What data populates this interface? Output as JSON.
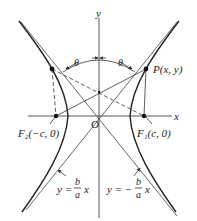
{
  "figure": {
    "type": "hyperbola-diagram",
    "axes": {
      "x_label": "x",
      "y_label": "y",
      "origin_label": "O"
    },
    "points": {
      "P": "P(x, y)",
      "F1": "F₁(c, 0)",
      "F2": "F₂(−c, 0)"
    },
    "angle_label": "θ",
    "asymptote_left": {
      "lhs": "y =",
      "num": "b",
      "den": "a",
      "rhs": "x"
    },
    "asymptote_right": {
      "lhs": "y = −",
      "num": "b",
      "den": "a",
      "rhs": "x"
    },
    "colors": {
      "line": "#333333",
      "background": "#ffffff"
    }
  }
}
